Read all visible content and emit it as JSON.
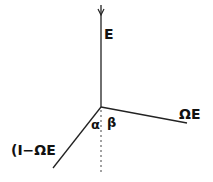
{
  "diagram": {
    "labels": {
      "top_vector": "E",
      "right_vector": "ΩE",
      "left_vector": "(I−ΩE",
      "angle_left": "α",
      "angle_right": "β"
    },
    "colors": {
      "line": "#222222",
      "background": "#ffffff"
    }
  }
}
